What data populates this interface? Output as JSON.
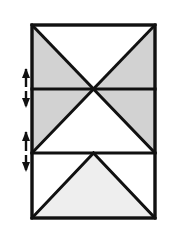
{
  "figure": {
    "canvas": {
      "width": 169,
      "height": 244,
      "background": "#ffffff"
    },
    "colors": {
      "outline": "#111111",
      "shade_dark": "#d2d2d2",
      "shade_light": "#eeeeee",
      "unshaded": "#ffffff",
      "arrow": "#111111"
    },
    "rectangle": {
      "label": "outer-rectangle",
      "left": 32,
      "top": 25,
      "right": 155,
      "bottom": 218,
      "width": 123,
      "height": 193,
      "stroke_width": 3
    },
    "dividers": [
      {
        "label": "divider-upper",
        "y": 89
      },
      {
        "label": "divider-lower",
        "y": 153
      }
    ],
    "center_x": 93.5,
    "bands": [
      {
        "label": "band-top",
        "top": 25,
        "bottom": 89,
        "pattern": "inverted-vee",
        "shaded_regions": 2,
        "fill": "#d2d2d2",
        "void_fill": "#ffffff"
      },
      {
        "label": "band-middle",
        "top": 89,
        "bottom": 153,
        "pattern": "double-diagonal",
        "shaded_regions": 2,
        "fill": "#d2d2d2",
        "void_fill": "#ffffff"
      },
      {
        "label": "band-bottom",
        "top": 153,
        "bottom": 218,
        "pattern": "upright-vee",
        "shaded_regions": 1,
        "fill": "#eeeeee",
        "void_fill": "#ffffff"
      }
    ],
    "dimension_markers": [
      {
        "label": "dimension-marker-upper",
        "x": 26,
        "top": 68,
        "bottom": 108,
        "mid": 89,
        "type": "double-headed-arrow",
        "orientation": "vertical"
      },
      {
        "label": "dimension-marker-lower",
        "x": 26,
        "top": 131,
        "bottom": 172,
        "mid": 153,
        "type": "double-headed-arrow",
        "orientation": "vertical"
      }
    ]
  }
}
